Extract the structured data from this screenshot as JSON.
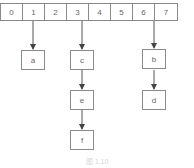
{
  "diagram": {
    "type": "hash-table-chaining",
    "array": {
      "cells": [
        "0",
        "1",
        "2",
        "3",
        "4",
        "5",
        "6",
        "7"
      ]
    },
    "nodes": [
      {
        "id": "a",
        "label": "a",
        "from_index": "1"
      },
      {
        "id": "c",
        "label": "c",
        "from_index": "3"
      },
      {
        "id": "e",
        "label": "e",
        "from": "c"
      },
      {
        "id": "f",
        "label": "f",
        "from": "e"
      },
      {
        "id": "b",
        "label": "b",
        "from_index": "6"
      },
      {
        "id": "d",
        "label": "d",
        "from": "b"
      }
    ],
    "edges": [
      [
        "cell-1",
        "a"
      ],
      [
        "cell-3",
        "c"
      ],
      [
        "c",
        "e"
      ],
      [
        "e",
        "f"
      ],
      [
        "cell-6",
        "b"
      ],
      [
        "b",
        "d"
      ]
    ],
    "caption": "图 1.10"
  },
  "colors": {
    "stroke": "#8a8a8a",
    "text": "#666666",
    "arrow": "#444444"
  }
}
